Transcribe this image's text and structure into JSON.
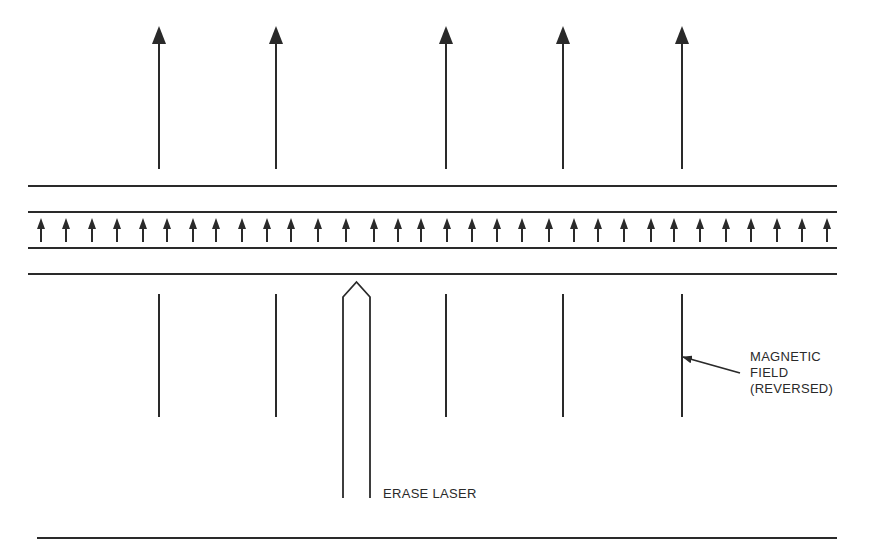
{
  "diagram": {
    "stroke_color": "#2a2a2a",
    "labels": {
      "magnetic_field": [
        "MAGNETIC",
        "FIELD",
        "(REVERSED)"
      ],
      "erase_laser": "ERASE LASER"
    },
    "external_field_arrows": {
      "direction": "up",
      "x": [
        159,
        276,
        446,
        563,
        682
      ],
      "tip_y": 26,
      "base_y": 169
    },
    "medium_layers_y": [
      186,
      212,
      248,
      274
    ],
    "medium_x_range": [
      28,
      837
    ],
    "magnetic_domain_arrows": {
      "direction": "up",
      "count": 32,
      "x": [
        41,
        66,
        92,
        117,
        143,
        167,
        193,
        216,
        242,
        267,
        291,
        318,
        346,
        374,
        398,
        421,
        447,
        472,
        497,
        522,
        549,
        574,
        598,
        624,
        651,
        674,
        700,
        726,
        751,
        777,
        802,
        827
      ],
      "top_y": 218,
      "bottom_y": 242
    },
    "field_lines_below": {
      "x": [
        159,
        276,
        446,
        563,
        682
      ],
      "top_y": 294,
      "bottom_y": 417
    },
    "erase_laser_beam": {
      "left_x": 343,
      "right_x": 370,
      "peak_y": 282,
      "shoulder_y": 297,
      "bottom_y": 498
    },
    "callout": {
      "from": [
        740,
        373
      ],
      "to": [
        683,
        357
      ]
    },
    "baseline": {
      "y": 538,
      "x_range": [
        37,
        837
      ]
    }
  }
}
